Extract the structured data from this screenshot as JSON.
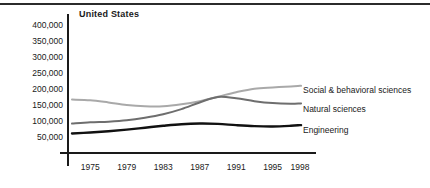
{
  "chart_data": {
    "type": "line",
    "title": "United States",
    "xlabel": "",
    "ylabel": "",
    "xlim": [
      1973,
      1998
    ],
    "ylim": [
      0,
      400000
    ],
    "grid": false,
    "legend_position": "inline-right",
    "x_ticks": [
      "1975",
      "1979",
      "1983",
      "1987",
      "1991",
      "1995",
      "1998"
    ],
    "x_tick_values": [
      1975,
      1979,
      1983,
      1987,
      1991,
      1995,
      1998
    ],
    "y_ticks": [
      "50,000",
      "100,000",
      "150,000",
      "200,000",
      "250,000",
      "300,000",
      "350,000",
      "400,000"
    ],
    "y_tick_values": [
      50000,
      100000,
      150000,
      200000,
      250000,
      300000,
      350000,
      400000
    ],
    "x": [
      1973,
      1975,
      1977,
      1979,
      1981,
      1983,
      1985,
      1987,
      1989,
      1991,
      1993,
      1995,
      1997,
      1998
    ],
    "series": [
      {
        "name": "Social & behavioral sciences",
        "color": "#a9a9a9",
        "values": [
          167000,
          165000,
          158000,
          150000,
          146000,
          146000,
          152000,
          162000,
          176000,
          190000,
          201000,
          205000,
          208000,
          210000
        ]
      },
      {
        "name": "Natural sciences",
        "color": "#6e6e6e",
        "values": [
          92000,
          96000,
          98000,
          102000,
          110000,
          121000,
          137000,
          158000,
          175000,
          171000,
          162000,
          156000,
          154000,
          155000
        ]
      },
      {
        "name": "Engineering",
        "color": "#111111",
        "values": [
          61000,
          64000,
          68000,
          73000,
          79000,
          85000,
          90000,
          92000,
          91000,
          87000,
          84000,
          83000,
          85000,
          87000
        ]
      }
    ]
  },
  "labels": {
    "social": "Social & behavioral sciences",
    "natural": "Natural sciences",
    "engineering": "Engineering"
  }
}
